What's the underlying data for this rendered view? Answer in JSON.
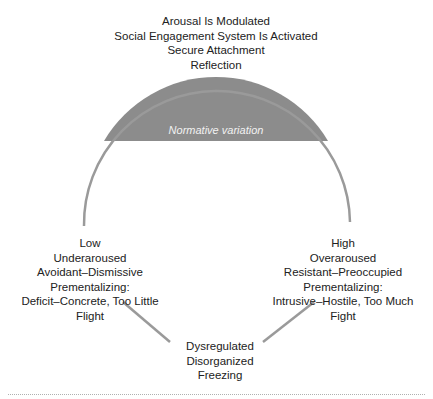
{
  "diagram": {
    "top": {
      "lines": [
        "Arousal Is Modulated",
        "Social Engagement System Is Activated",
        "Secure Attachment",
        "Reflection"
      ]
    },
    "segment_label": "Normative variation",
    "left": {
      "lines": [
        "Low",
        "Underaroused",
        "Avoidant–Dismissive",
        "Prementalizing:",
        "Deficit–Concrete, Too Little",
        "Flight"
      ]
    },
    "right": {
      "lines": [
        "High",
        "Overaroused",
        "Resistant–Preoccupied",
        "Prementalizing:",
        "Intrusive–Hostile, Too Much",
        "Fight"
      ]
    },
    "bottom": {
      "lines": [
        "Dysregulated",
        "Disorganized",
        "Freezing"
      ]
    },
    "colors": {
      "segment_fill": "#8c8c8c",
      "arc_stroke": "#9a9a9a",
      "text": "#222222"
    }
  }
}
